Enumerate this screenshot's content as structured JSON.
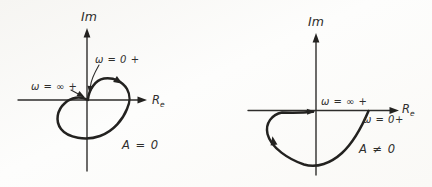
{
  "figure": {
    "colors": {
      "ink": "#2e2d2b",
      "background": "#faf9f6"
    },
    "panels": [
      {
        "id": "left",
        "im_label": "Im",
        "re_label_main": "R",
        "re_label_sub": "e",
        "omega_zero_label": "ω = 0 +",
        "omega_inf_label": "ω = ∞ +",
        "gain_label": "A = 0",
        "curve_d": "M88,99 C89,90 95,80 104,78.5 C114,77 123,82 127,89 C130.5,95 130,103 127,109 C123,119 114,131 100,136 C86,141 68,138 61,129 C55,121 57,110 65,103 C71,97.5 80,95.5 88,100",
        "leader_d": "M99,65 C95,72 91,80 90.5,86",
        "inf_arrow_d": "M71,90 L81,95.5"
      },
      {
        "id": "right",
        "im_label": "Im",
        "re_label_main": "R",
        "re_label_sub": "e",
        "omega_zero_label": "ω = 0+",
        "omega_inf_label": "ω = ∞ +",
        "gain_label": "A ≠ 0",
        "curve_d": "M368.5,111 C363,124 355,141 342,153 C331,163 317,168.5 304,164.5 C289,159.5 271,148 267.5,134 C265,123 272,114.5 282,112.5 C293,112.8 306,112.5 313,111.8"
      }
    ]
  }
}
